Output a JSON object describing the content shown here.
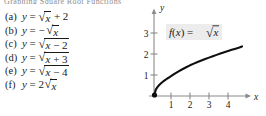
{
  "artifact": {
    "top_text": "Graphing Square Root Functions"
  },
  "equation_list": {
    "name": "square-root-transformations",
    "items": [
      {
        "tag": "(a)",
        "lhs": "y",
        "eq": "=",
        "prefix": "",
        "radicand": "x",
        "tail": "+ 2",
        "bar_over_all": false
      },
      {
        "tag": "(b)",
        "lhs": "y",
        "eq": "=",
        "prefix": "−",
        "radicand": "x",
        "tail": "",
        "bar_over_all": false
      },
      {
        "tag": "(c)",
        "lhs": "y",
        "eq": "=",
        "prefix": "",
        "radicand": "x − 2",
        "tail": "",
        "bar_over_all": true
      },
      {
        "tag": "(d)",
        "lhs": "y",
        "eq": "=",
        "prefix": "",
        "radicand": "x + 3",
        "tail": "",
        "bar_over_all": true
      },
      {
        "tag": "(e)",
        "lhs": "y",
        "eq": "=",
        "prefix": "",
        "radicand": "x − 4",
        "tail": "",
        "bar_over_all": true
      },
      {
        "tag": "(f)",
        "lhs": "y",
        "eq": "=",
        "prefix": "2",
        "radicand": "x",
        "tail": "",
        "bar_over_all": false
      }
    ]
  },
  "graph": {
    "title_label": "f(x) = √x",
    "axis_x_label": "x",
    "axis_y_label": "y",
    "origin_dot": true,
    "colors": {
      "curve": "#0f0f0f",
      "axis": "#8a8a8a",
      "tick": "#8a8a8a",
      "text": "#1a1a1a",
      "label_box": "#ececec"
    }
  },
  "chart_data": {
    "type": "line",
    "xlabel": "x",
    "ylabel": "y",
    "xlim": [
      0,
      4.8
    ],
    "ylim": [
      0,
      3.6
    ],
    "xticks": [
      1,
      2,
      3,
      4
    ],
    "yticks": [
      1,
      2,
      3
    ],
    "grid": false,
    "legend": "none",
    "annotations": [
      "f(x) = √x"
    ],
    "series": [
      {
        "name": "f(x) = sqrt(x)",
        "x": [
          0,
          0.1,
          0.2,
          0.3,
          0.5,
          0.75,
          1.0,
          1.25,
          1.5,
          2.0,
          2.5,
          3.0,
          3.5,
          4.0,
          4.5
        ],
        "y": [
          0,
          0.316,
          0.447,
          0.548,
          0.707,
          0.866,
          1.0,
          1.118,
          1.225,
          1.414,
          1.581,
          1.732,
          1.871,
          2.0,
          2.121
        ]
      }
    ]
  }
}
